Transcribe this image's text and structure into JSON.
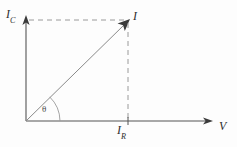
{
  "figure": {
    "type": "phasor-diagram",
    "background_color": "#fdfdfd",
    "line_color": "#8a8a8a",
    "axis_color": "#555555",
    "text_color": "#2e2e2e"
  },
  "axes": {
    "vertical": {
      "label_base": "I",
      "label_sub": "C",
      "origin": [
        26,
        121
      ],
      "tip": [
        26,
        18
      ],
      "arrow": "up"
    },
    "horizontal": {
      "label": "V",
      "origin": [
        26,
        121
      ],
      "tip": [
        212,
        121
      ],
      "arrow": "right"
    }
  },
  "vectors": [
    {
      "name": "resultant-current",
      "label_base": "I",
      "label_sub": "",
      "from": [
        26,
        121
      ],
      "to": [
        128,
        21
      ],
      "arrow": "up-right"
    }
  ],
  "projections": [
    {
      "name": "capacitive-current-projection",
      "style": "dashed",
      "from": [
        28,
        20
      ],
      "to": [
        128,
        20
      ],
      "axis": "vertical"
    },
    {
      "name": "resistive-current-projection",
      "style": "dashed",
      "from": [
        128,
        22
      ],
      "to": [
        128,
        121
      ],
      "axis": "horizontal"
    }
  ],
  "tick_labels": [
    {
      "name": "resistive-current-tick",
      "label_base": "I",
      "label_sub": "R",
      "position": [
        128,
        121
      ]
    }
  ],
  "angle": {
    "name": "phase-angle",
    "symbol": "θ",
    "vertex": [
      26,
      121
    ],
    "arc_radius": 34,
    "between": [
      "horizontal-axis",
      "resultant-current"
    ]
  }
}
